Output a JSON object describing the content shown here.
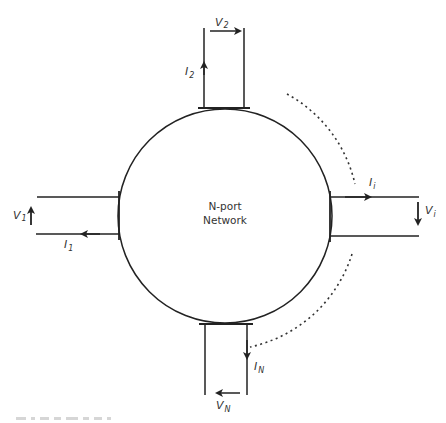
{
  "diagram": {
    "center_label_line1": "N-port",
    "center_label_line2": "Network",
    "ports": {
      "port1": {
        "voltage": "V",
        "voltage_sub": "1",
        "current": "I",
        "current_sub": "1"
      },
      "port2": {
        "voltage": "V",
        "voltage_sub": "2",
        "current": "I",
        "current_sub": "2"
      },
      "porti": {
        "voltage": "V",
        "voltage_sub": "i",
        "current": "I",
        "current_sub": "i"
      },
      "portN": {
        "voltage": "V",
        "voltage_sub": "N",
        "current": "I",
        "current_sub": "N"
      }
    },
    "colors": {
      "stroke": "#222222",
      "text": "#333333",
      "background": "#ffffff"
    }
  }
}
